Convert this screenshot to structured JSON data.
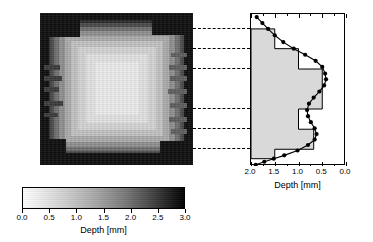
{
  "figure": {
    "title": "",
    "panels": [
      "depth-map",
      "depth-profile",
      "colorbar"
    ]
  },
  "depth_map": {
    "name": "depth-map",
    "description": "grayscale depth map of a nested rectangular feature",
    "colormap": "grayscale-inverted",
    "bounds_px": {
      "left": 40,
      "top": 13,
      "width": 153,
      "height": 152
    }
  },
  "connectors": {
    "name": "dashed-connector-lines",
    "count": 6,
    "y_positions_px": [
      28,
      48,
      68,
      108,
      128,
      148
    ],
    "style": "dashed",
    "color": "#000000"
  },
  "colorbar": {
    "label": "Depth [mm]",
    "ticks": [
      "0.0",
      "0.5",
      "1.0",
      "1.5",
      "2.0",
      "2.5",
      "3.0"
    ],
    "tick_values": [
      0.0,
      0.5,
      1.0,
      1.5,
      2.0,
      2.5,
      3.0
    ],
    "min_color": "#ffffff",
    "max_color": "#000000",
    "orientation": "horizontal"
  },
  "chart_data": {
    "type": "line",
    "title": "",
    "xlabel": "Depth [mm]",
    "ylabel": "",
    "xlim": [
      2.0,
      0.0
    ],
    "ylim": [
      0,
      152
    ],
    "x_reversed": true,
    "grid": false,
    "legend": null,
    "xticks": [
      2.0,
      1.5,
      1.0,
      0.5,
      0.0
    ],
    "xticklabels": [
      "2.0",
      "1.5",
      "1.0",
      "0.5",
      "0.0"
    ],
    "series": [
      {
        "name": "measured depth profile",
        "type": "line-with-markers",
        "marker": "filled-circle",
        "color": "#000000",
        "points": [
          {
            "depth": 1.88,
            "pos": 0.02
          },
          {
            "depth": 1.76,
            "pos": 0.06
          },
          {
            "depth": 1.64,
            "pos": 0.098
          },
          {
            "depth": 1.5,
            "pos": 0.14
          },
          {
            "depth": 1.32,
            "pos": 0.185
          },
          {
            "depth": 1.1,
            "pos": 0.228
          },
          {
            "depth": 0.86,
            "pos": 0.268
          },
          {
            "depth": 0.64,
            "pos": 0.308
          },
          {
            "depth": 0.5,
            "pos": 0.348
          },
          {
            "depth": 0.44,
            "pos": 0.392
          },
          {
            "depth": 0.42,
            "pos": 0.43
          },
          {
            "depth": 0.46,
            "pos": 0.47
          },
          {
            "depth": 0.56,
            "pos": 0.51
          },
          {
            "depth": 0.68,
            "pos": 0.55
          },
          {
            "depth": 0.78,
            "pos": 0.59
          },
          {
            "depth": 0.82,
            "pos": 0.632
          },
          {
            "depth": 0.8,
            "pos": 0.672
          },
          {
            "depth": 0.74,
            "pos": 0.712
          },
          {
            "depth": 0.66,
            "pos": 0.752
          },
          {
            "depth": 0.62,
            "pos": 0.79
          },
          {
            "depth": 0.66,
            "pos": 0.826
          },
          {
            "depth": 0.8,
            "pos": 0.862
          },
          {
            "depth": 1.02,
            "pos": 0.898
          },
          {
            "depth": 1.3,
            "pos": 0.93
          },
          {
            "depth": 1.52,
            "pos": 0.952
          },
          {
            "depth": 1.72,
            "pos": 0.972
          },
          {
            "depth": 1.9,
            "pos": 0.992
          }
        ]
      },
      {
        "name": "nominal step profile (histogram)",
        "type": "step-filled",
        "fill_color": "#d9d9d9",
        "edge_color": "#000000",
        "steps": [
          {
            "depth": 1.5,
            "pos_start": 0.098,
            "pos_end": 0.228
          },
          {
            "depth": 1.0,
            "pos_start": 0.228,
            "pos_end": 0.362
          },
          {
            "depth": 0.5,
            "pos_start": 0.362,
            "pos_end": 0.625
          },
          {
            "depth": 1.0,
            "pos_start": 0.625,
            "pos_end": 0.758
          },
          {
            "depth": 0.68,
            "pos_start": 0.758,
            "pos_end": 0.89
          },
          {
            "depth": 1.5,
            "pos_start": 0.89,
            "pos_end": 0.952
          }
        ]
      }
    ]
  }
}
